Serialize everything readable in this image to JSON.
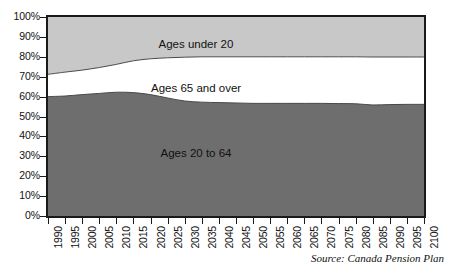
{
  "chart_data": {
    "type": "area",
    "title": "",
    "subtitle": "",
    "xlabel": "",
    "ylabel": "",
    "stacked": true,
    "stack_total_percent": 100,
    "grid": false,
    "legend_position": "in-plot-labels",
    "xlim": [
      1990,
      2100
    ],
    "ylim": [
      0,
      100
    ],
    "y_tick_labels": [
      "100%",
      "90%",
      "80%",
      "70%",
      "60%",
      "50%",
      "40%",
      "30%",
      "20%",
      "10%",
      "0%"
    ],
    "y_tick_values": [
      100,
      90,
      80,
      70,
      60,
      50,
      40,
      30,
      20,
      10,
      0
    ],
    "categories": [
      "1990",
      "1995",
      "2000",
      "2005",
      "2010",
      "2015",
      "2020",
      "2025",
      "2030",
      "2035",
      "2040",
      "2045",
      "2050",
      "2055",
      "2060",
      "2065",
      "2070",
      "2075",
      "2080",
      "2085",
      "2090",
      "2095",
      "2100"
    ],
    "x": [
      1990,
      1995,
      2000,
      2005,
      2010,
      2015,
      2020,
      2025,
      2030,
      2035,
      2040,
      2045,
      2050,
      2055,
      2060,
      2065,
      2070,
      2075,
      2080,
      2085,
      2090,
      2095,
      2100
    ],
    "series": [
      {
        "name": "Ages 20 to 64",
        "color": "#6e6e6e",
        "values": [
          60.0,
          60.3,
          61.0,
          61.6,
          62.2,
          62.0,
          61.0,
          59.3,
          57.8,
          57.2,
          57.0,
          56.8,
          56.6,
          56.6,
          56.6,
          56.6,
          56.6,
          56.5,
          56.4,
          55.8,
          56.0,
          56.1,
          56.1
        ]
      },
      {
        "name": "Ages 65 and over",
        "color": "#ffffff",
        "values": [
          11.2,
          12.0,
          12.3,
          13.0,
          14.0,
          16.0,
          18.0,
          20.2,
          22.0,
          22.8,
          23.0,
          23.2,
          23.4,
          23.4,
          23.4,
          23.4,
          23.4,
          23.5,
          23.6,
          24.1,
          23.9,
          23.8,
          23.8
        ]
      },
      {
        "name": "Ages under 20",
        "color": "#c8c8c8",
        "values": [
          28.8,
          27.7,
          26.7,
          25.4,
          23.8,
          22.0,
          21.0,
          20.5,
          20.2,
          20.0,
          20.0,
          20.0,
          20.0,
          20.0,
          20.0,
          20.0,
          20.0,
          20.0,
          20.0,
          20.1,
          20.1,
          20.1,
          20.1
        ]
      }
    ],
    "cumulative_upper_boundaries": {
      "ages_20_to_64_top": [
        60.0,
        60.3,
        61.0,
        61.6,
        62.2,
        62.0,
        61.0,
        59.3,
        57.8,
        57.2,
        57.0,
        56.8,
        56.6,
        56.6,
        56.6,
        56.6,
        56.6,
        56.5,
        56.4,
        55.8,
        56.0,
        56.1,
        56.1
      ],
      "ages_65_and_over_top": [
        71.2,
        72.3,
        73.3,
        74.6,
        76.2,
        78.0,
        79.0,
        79.5,
        79.8,
        80.0,
        80.0,
        80.0,
        80.0,
        80.0,
        80.0,
        80.0,
        80.0,
        80.0,
        80.0,
        79.9,
        79.9,
        79.9,
        79.9
      ]
    },
    "annotations": [
      {
        "name": "label-under-20",
        "text": "Ages under 20"
      },
      {
        "name": "label-65-over",
        "text": "Ages 65 and over"
      },
      {
        "name": "label-20-64",
        "text": "Ages 20 to 64"
      }
    ],
    "source": "Source: Canada Pension Plan"
  },
  "chart": {
    "labels": {
      "ages_under_20": "Ages under 20",
      "ages_65_and_over": "Ages 65 and over",
      "ages_20_to_64": "Ages 20 to 64"
    },
    "source_note": "Source: Canada Pension Plan",
    "colors": {
      "ages_under_20": "#c8c8c8",
      "ages_65_and_over": "#ffffff",
      "ages_20_to_64": "#6e6e6e",
      "axis": "#1a1a1a",
      "text": "#111111",
      "background": "#ffffff"
    }
  }
}
